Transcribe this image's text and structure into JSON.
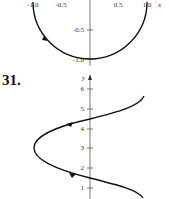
{
  "figures": [
    {
      "id": "top",
      "x_ticks": [
        "-1.0",
        "-0.5",
        "0.5",
        "1.0"
      ],
      "x_axis_label": "x",
      "y_ticks": [
        "-0.5",
        "-1.0"
      ],
      "curve": "lower semicircle with arrow (clockwise direction)"
    },
    {
      "id": "31",
      "number_label": "31.",
      "y_axis_label": "y",
      "y_ticks": [
        "6",
        "5",
        "4",
        "3",
        "2",
        "1"
      ],
      "curve": "sideways sine-like curve with direction arrows"
    }
  ]
}
